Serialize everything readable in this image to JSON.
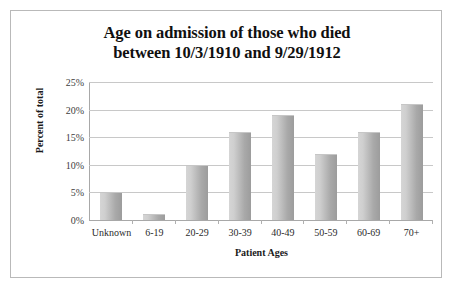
{
  "chart_data": {
    "type": "bar",
    "title": "Age on admission of those who died between 10/3/1910 and 9/29/1912",
    "title_lines": [
      "Age on admission of those who died",
      "between 10/3/1910 and 9/29/1912"
    ],
    "categories": [
      "Unknown",
      "6-19",
      "20-29",
      "30-39",
      "40-49",
      "50-59",
      "60-69",
      "70+"
    ],
    "values": [
      5,
      1,
      10,
      16,
      19,
      12,
      16,
      21
    ],
    "value_labels": [
      "5%",
      "1%",
      "10%",
      "16%",
      "19%",
      "12%",
      "16%",
      "21%"
    ],
    "xlabel": "Patient Ages",
    "ylabel": "Percent of total",
    "ylim": [
      0,
      25
    ],
    "ytick_values": [
      25,
      20,
      15,
      10,
      5,
      0
    ],
    "yticks": [
      "25%",
      "20%",
      "15%",
      "10%",
      "5%",
      "0%"
    ],
    "grid": true,
    "legend": false,
    "series_color": "#b4b4b4",
    "gridline_color": "#c8c8c8",
    "frame_color": "#b9b9b9",
    "background": "#ffffff"
  }
}
